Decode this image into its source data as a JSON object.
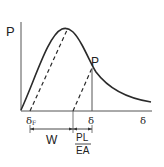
{
  "diagram": {
    "type": "load-deflection curve",
    "labels": {
      "y_axis": "P",
      "x_axis": "δ",
      "point_P": "P",
      "delta_F": "δ",
      "delta_F_sub": "F",
      "delta": "δ",
      "W": "W",
      "PL": "PL",
      "EA": "EA"
    },
    "colors": {
      "line": "#2a2a2a",
      "background": "#ffffff"
    }
  }
}
